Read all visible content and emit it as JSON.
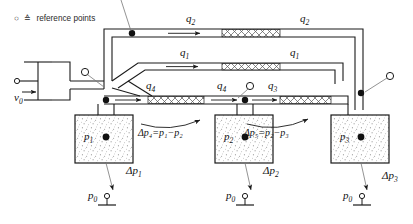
{
  "diagram": {
    "legend": {
      "symbol_circle": "○",
      "symbol_equals": "≙",
      "text": "reference points"
    },
    "inlet": {
      "velocity_label": "v",
      "velocity_sub": "0"
    },
    "flows": [
      {
        "name": "q2",
        "label": "q",
        "sub": "2",
        "x": 186,
        "y": 20
      },
      {
        "name": "q2-right",
        "label": "q",
        "sub": "2",
        "x": 300,
        "y": 20
      },
      {
        "name": "q1",
        "label": "q",
        "sub": "1",
        "x": 180,
        "y": 57
      },
      {
        "name": "q1-right",
        "label": "q",
        "sub": "1",
        "x": 290,
        "y": 57
      },
      {
        "name": "q4",
        "label": "q",
        "sub": "4",
        "x": 146,
        "y": 88
      },
      {
        "name": "q4-right",
        "label": "q",
        "sub": "4",
        "x": 217,
        "y": 88
      },
      {
        "name": "q3",
        "label": "q",
        "sub": "3",
        "x": 268,
        "y": 88
      }
    ],
    "chambers": [
      {
        "name": "p1",
        "label": "p",
        "sub": "1",
        "box_x": 75,
        "box_y": 115,
        "box_w": 58,
        "box_h": 48
      },
      {
        "name": "p2",
        "label": "p",
        "sub": "2",
        "box_x": 215,
        "box_y": 115,
        "box_w": 58,
        "box_h": 48
      },
      {
        "name": "p3",
        "label": "p",
        "sub": "3",
        "box_x": 331,
        "box_y": 115,
        "box_w": 58,
        "box_h": 48
      }
    ],
    "deltas": [
      {
        "name": "dp1",
        "label": "Δp",
        "sub": "1",
        "x": 128,
        "y": 168
      },
      {
        "name": "dp2",
        "label": "Δp",
        "sub": "2",
        "x": 266,
        "y": 168
      },
      {
        "name": "dp3",
        "label": "Δp",
        "sub": "3",
        "x": 384,
        "y": 172
      }
    ],
    "equations": [
      {
        "name": "dp4-equation",
        "text": "Δp₄=p₁−p₂",
        "x": 140,
        "y": 129
      },
      {
        "name": "dp5-equation",
        "text": "Δp₅=p₂−p₃",
        "x": 245,
        "y": 129
      }
    ],
    "ambient": [
      {
        "name": "p0-left",
        "label": "p",
        "sub": "0",
        "x": 90,
        "y": 194
      },
      {
        "name": "p0-mid",
        "label": "p",
        "sub": "0",
        "x": 228,
        "y": 194
      },
      {
        "name": "p0-right",
        "label": "p",
        "sub": "0",
        "x": 345,
        "y": 194
      }
    ],
    "colors": {
      "stroke": "#1a1a1a",
      "hatch": "#555555",
      "stipple": "#777777",
      "leader": "#666666",
      "background": "#ffffff"
    }
  }
}
